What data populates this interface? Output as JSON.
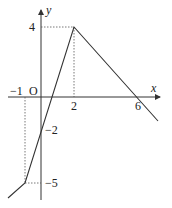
{
  "diagram": {
    "type": "piecewise-linear function graph",
    "axes": {
      "x_label": "x",
      "y_label": "y",
      "origin_label": "O"
    },
    "x_ticks": [
      "-1",
      "2",
      "6"
    ],
    "y_ticks": [
      "4",
      "-2",
      "-5"
    ],
    "points": [
      {
        "x": -1,
        "y": -5
      },
      {
        "x": 0,
        "y": -2
      },
      {
        "x": 2,
        "y": 4
      },
      {
        "x": 6,
        "y": 0
      }
    ]
  }
}
